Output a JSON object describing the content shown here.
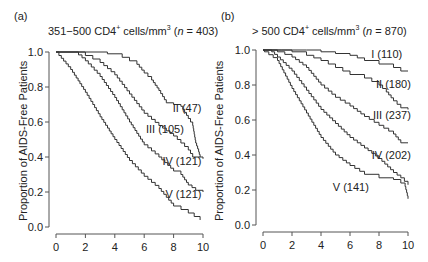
{
  "chart_data": [
    {
      "type": "line",
      "panel_label": "(a)",
      "title": "351−500 CD4+ cells/mm3 (n = 403)",
      "title_parts": {
        "pre": "351−500 CD4",
        "sup1": "+",
        "mid": " cells/mm",
        "sup2": "3",
        "n_open": " (",
        "n_var": "n",
        "n_rest": " = 403)"
      },
      "xlabel": "",
      "ylabel": "Proportion of AIDS-Free Patients",
      "xlim": [
        0,
        10
      ],
      "ylim": [
        0.0,
        1.0
      ],
      "xticks": [
        0,
        2,
        4,
        6,
        8,
        10
      ],
      "yticks": [
        "0.0",
        "0.2",
        "0.4",
        "0.6",
        "0.8",
        "1.0"
      ],
      "grid": false,
      "series": [
        {
          "name": "II (47)",
          "x": [
            0,
            2,
            3.5,
            4.5,
            5.5,
            6,
            6.5,
            7,
            7.5,
            8,
            8.5,
            9,
            9.3,
            9.5,
            9.7,
            9.8
          ],
          "values": [
            1.0,
            1.0,
            0.99,
            0.97,
            0.93,
            0.88,
            0.84,
            0.78,
            0.71,
            0.7,
            0.69,
            0.62,
            0.58,
            0.48,
            0.43,
            0.4
          ]
        },
        {
          "name": "III (105)",
          "x": [
            0,
            1.5,
            2,
            3,
            4,
            5,
            6,
            7,
            8,
            8.5,
            9,
            9.3,
            10
          ],
          "values": [
            1.0,
            1.0,
            0.98,
            0.94,
            0.87,
            0.76,
            0.65,
            0.58,
            0.52,
            0.48,
            0.44,
            0.4,
            0.39
          ]
        },
        {
          "name": "IV (121)",
          "x": [
            0,
            1.3,
            2,
            3,
            4,
            5,
            6,
            7,
            8,
            8.5,
            9,
            9.5,
            10
          ],
          "values": [
            1.0,
            1.0,
            0.95,
            0.86,
            0.74,
            0.6,
            0.47,
            0.4,
            0.32,
            0.3,
            0.24,
            0.21,
            0.2
          ]
        },
        {
          "name": "V (121)",
          "x": [
            0,
            0.2,
            1,
            2,
            3,
            4,
            5,
            6,
            7,
            8,
            9,
            9.8
          ],
          "values": [
            1.0,
            0.98,
            0.9,
            0.77,
            0.63,
            0.5,
            0.38,
            0.29,
            0.22,
            0.12,
            0.08,
            0.04
          ]
        }
      ],
      "annotations": [
        "II (47)",
        "III (105)",
        "IV (121)",
        "V (121)"
      ]
    },
    {
      "type": "line",
      "panel_label": "(b)",
      "title": "> 500 CD4+ cells/mm3 (n = 870)",
      "title_parts": {
        "pre": "> 500 CD4",
        "sup1": "+",
        "mid": " cells/mm",
        "sup2": "3",
        "n_open": " (",
        "n_var": "n",
        "n_rest": " = 870)"
      },
      "xlabel": "",
      "ylabel": "Proportion of AIDS-Free Patients",
      "xlim": [
        0,
        10
      ],
      "ylim": [
        0.0,
        1.0
      ],
      "xticks": [
        0,
        2,
        4,
        6,
        8,
        10
      ],
      "yticks": [
        "0.0",
        "0.2",
        "0.4",
        "0.6",
        "0.8",
        "1.0"
      ],
      "grid": false,
      "series": [
        {
          "name": "I (110)",
          "x": [
            0,
            3,
            4,
            5,
            6,
            7,
            8,
            9,
            9.5,
            10
          ],
          "values": [
            1.0,
            1.0,
            0.99,
            0.98,
            0.97,
            0.94,
            0.92,
            0.9,
            0.88,
            0.88
          ]
        },
        {
          "name": "II (180)",
          "x": [
            0,
            1.3,
            2,
            3,
            4,
            5,
            6,
            7,
            8,
            8.5,
            9,
            9.5,
            10
          ],
          "values": [
            1.0,
            1.0,
            0.99,
            0.97,
            0.94,
            0.9,
            0.86,
            0.84,
            0.8,
            0.76,
            0.71,
            0.67,
            0.66
          ]
        },
        {
          "name": "III (237)",
          "x": [
            0,
            1,
            2,
            3,
            4,
            5,
            6,
            7,
            8,
            9,
            9.5,
            10
          ],
          "values": [
            1.0,
            0.99,
            0.96,
            0.9,
            0.8,
            0.73,
            0.68,
            0.62,
            0.57,
            0.52,
            0.47,
            0.47
          ]
        },
        {
          "name": "IV (202)",
          "x": [
            0,
            0.6,
            1,
            2,
            3,
            4,
            5,
            6,
            7,
            8,
            9,
            9.5,
            10
          ],
          "values": [
            1.0,
            0.99,
            0.96,
            0.88,
            0.77,
            0.66,
            0.58,
            0.5,
            0.44,
            0.38,
            0.3,
            0.27,
            0.23
          ]
        },
        {
          "name": "V (141)",
          "x": [
            0,
            0.1,
            1,
            2,
            3,
            4,
            5,
            6,
            7,
            8,
            9,
            9.5,
            9.8,
            10
          ],
          "values": [
            1.0,
            0.99,
            0.94,
            0.78,
            0.64,
            0.5,
            0.4,
            0.34,
            0.29,
            0.27,
            0.26,
            0.24,
            0.22,
            0.15
          ]
        }
      ],
      "annotations": [
        "I (110)",
        "II (180)",
        "III (237)",
        "IV (202)",
        "V (141)"
      ]
    }
  ],
  "style": {
    "line_color": "#333333",
    "axis_color": "#555555",
    "background": "#ffffff"
  }
}
